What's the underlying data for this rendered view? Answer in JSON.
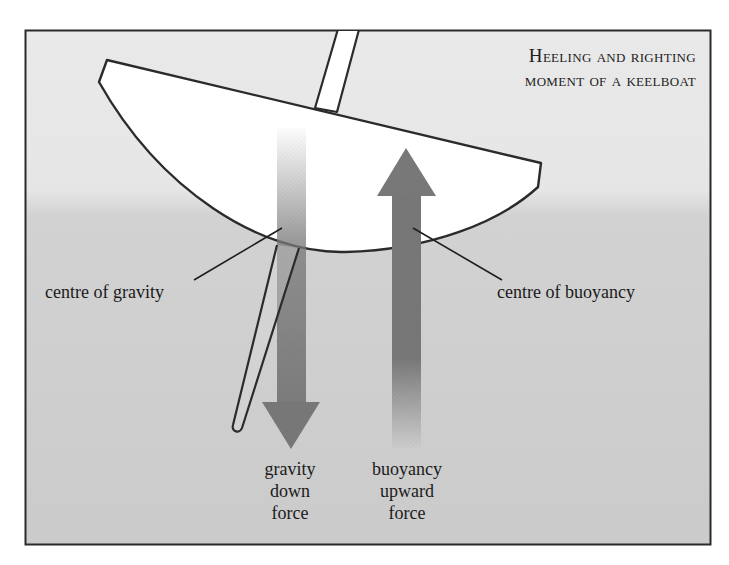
{
  "diagram": {
    "title_line1": "Heeling and righting",
    "title_line2": "moment of a keelboat",
    "labels": {
      "centre_of_gravity": "centre of gravity",
      "centre_of_buoyancy": "centre of buoyancy"
    },
    "forces": {
      "gravity": {
        "line1": "gravity",
        "line2": "down",
        "line3": "force",
        "direction": "down"
      },
      "buoyancy": {
        "line1": "buoyancy",
        "line2": "upward",
        "line3": "force",
        "direction": "up"
      }
    },
    "colors": {
      "frame_border": "#2a2a2a",
      "air": "#e8e8e8",
      "water": "#cdcdcd",
      "hull_fill": "#ffffff",
      "outline": "#2b2b2b",
      "arrow": "#7a7a7a"
    }
  }
}
